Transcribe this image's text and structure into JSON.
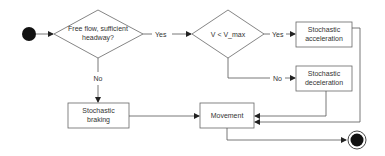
{
  "diagram": {
    "type": "flowchart",
    "colors": {
      "stroke": "#555555",
      "text": "#333333",
      "fill": "#ffffff",
      "terminal": "#111111"
    },
    "nodes": {
      "start": {
        "kind": "start-node"
      },
      "decision1": {
        "kind": "decision",
        "line1": "Free flow, sufficient",
        "line2": "headway?"
      },
      "decision2": {
        "kind": "decision",
        "line1": "V < V_max"
      },
      "accel": {
        "kind": "process",
        "line1": "Stochastic",
        "line2": "acceleration"
      },
      "decel": {
        "kind": "process",
        "line1": "Stochastic",
        "line2": "deceleration"
      },
      "braking": {
        "kind": "process",
        "line1": "Stochastic",
        "line2": "braking"
      },
      "movement": {
        "kind": "process",
        "line1": "Movement"
      },
      "end": {
        "kind": "end-node"
      }
    },
    "edges": {
      "d1_yes": "Yes",
      "d1_no": "No",
      "d2_yes": "Yes",
      "d2_no": "No"
    }
  }
}
